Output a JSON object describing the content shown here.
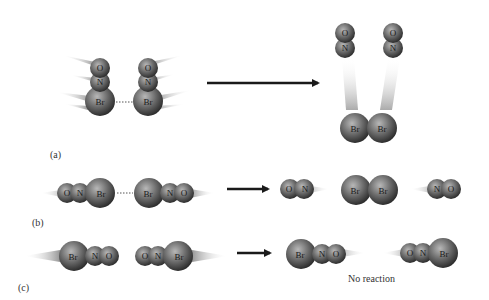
{
  "figure": {
    "panels": [
      {
        "id": "a",
        "label": "(a)",
        "reactants": [
          "O",
          "N",
          "Br",
          "O",
          "N",
          "Br"
        ],
        "reactant_atoms": {
          "left": {
            "top": "O",
            "mid": "N",
            "bottom": "Br"
          },
          "right": {
            "top": "O",
            "mid": "N",
            "bottom": "Br"
          }
        },
        "products": {
          "left_no": {
            "top": "O",
            "bottom": "N"
          },
          "right_no": {
            "top": "O",
            "bottom": "N"
          },
          "br2": [
            "Br",
            "Br"
          ]
        }
      },
      {
        "id": "b",
        "label": "(b)",
        "reactant_atoms": {
          "left": [
            "O",
            "N",
            "Br"
          ],
          "right": [
            "Br",
            "N",
            "O"
          ]
        },
        "products": {
          "no_left": [
            "O",
            "N"
          ],
          "br2": [
            "Br",
            "Br"
          ],
          "no_right": [
            "N",
            "O"
          ]
        }
      },
      {
        "id": "c",
        "label": "(c)",
        "reactant_atoms": {
          "left": [
            "Br",
            "N",
            "O"
          ],
          "right": [
            "O",
            "N",
            "Br"
          ]
        },
        "products": {
          "left": [
            "Br",
            "N",
            "O"
          ],
          "right": [
            "O",
            "N",
            "Br"
          ]
        },
        "note": "No reaction"
      }
    ],
    "colors": {
      "atom_dark": "#3a3a3a",
      "atom_light": "#b0b0b0",
      "arrow": "#1a1a1a",
      "streak": "#c8c8c8"
    }
  }
}
